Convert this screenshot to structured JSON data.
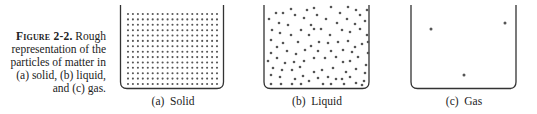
{
  "figure": {
    "caption": {
      "label": "Figure 2-2.",
      "lines": [
        "Rough",
        "representation of the",
        "particles of matter in",
        "(a) solid, (b) liquid,",
        "and (c) gas."
      ]
    },
    "panels": [
      {
        "id": "a",
        "label": "(a)  Solid",
        "state": "solid",
        "particle_layout": "regular grid",
        "grid_columns": 19,
        "grid_rows": 14
      },
      {
        "id": "b",
        "label": "(b)  Liquid",
        "state": "liquid",
        "particle_layout": "random, close-packed"
      },
      {
        "id": "c",
        "label": "(c)  Gas",
        "state": "gas",
        "particle_layout": "sparse",
        "particle_count": 3
      }
    ],
    "colors": {
      "ink": "#333333",
      "particle": "#555555",
      "background": "#ffffff"
    }
  }
}
